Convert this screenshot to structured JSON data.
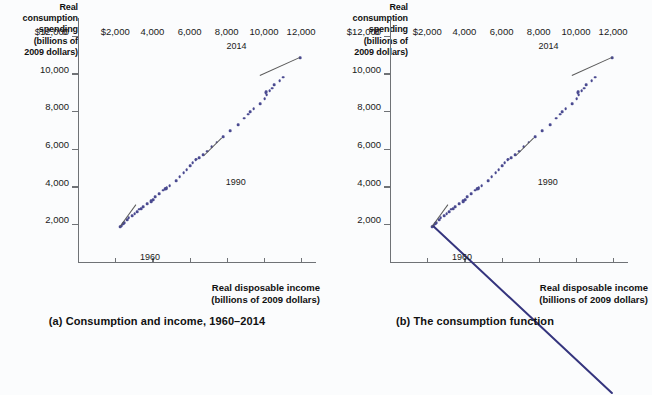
{
  "figure": {
    "background_color": "#fbfcfd",
    "dot_color": "#4a4a90",
    "line_color": "#35357e",
    "axis_color": "#6f7276"
  },
  "panels": [
    {
      "id": "a",
      "caption": "(a) Consumption and income, 1960–2014",
      "y_axis_title": "Real consumption spending (billions of 2009 dollars)",
      "x_axis_title": "Real disposable income (billions of 2009 dollars)",
      "y_axis_title_lines": [
        "Real",
        "consumption",
        "spending",
        "(billions of",
        "2009 dollars)"
      ],
      "x_axis_title_lines": [
        "Real disposable income",
        "(billions of 2009 dollars)"
      ],
      "origin_label": "0",
      "annotations": [
        {
          "label": "1960",
          "x": 2262,
          "y": 1930
        },
        {
          "label": "1990",
          "x": 6766,
          "y": 5672
        },
        {
          "label": "2014",
          "x": 11965,
          "y": 10873
        }
      ]
    },
    {
      "id": "b",
      "caption": "(b) The consumption function",
      "y_axis_title": "Real consumption spending (billions of 2009 dollars)",
      "x_axis_title": "Real disposable income (billions of 2009 dollars)",
      "y_axis_title_lines": [
        "Real",
        "consumption",
        "spending",
        "(billions of",
        "2009 dollars)"
      ],
      "x_axis_title_lines": [
        "Real disposable income",
        "(billions of 2009 dollars)"
      ],
      "origin_label": "0",
      "annotations": [
        {
          "label": "1960",
          "x": 2262,
          "y": 1930
        },
        {
          "label": "1990",
          "x": 6766,
          "y": 5672
        },
        {
          "label": "2014",
          "x": 11965,
          "y": 10873
        }
      ]
    }
  ],
  "chart_data": [
    {
      "type": "scatter",
      "panel": "a",
      "title": "(a) Consumption and income, 1960–2014",
      "xlabel": "Real disposable income (billions of 2009 dollars)",
      "ylabel": "Real consumption spending (billions of 2009 dollars)",
      "xlim": [
        0,
        12800
      ],
      "ylim": [
        0,
        13000
      ],
      "xticks": [
        0,
        2000,
        4000,
        6000,
        8000,
        10000,
        12000
      ],
      "xticklabels": [
        "0",
        "$2,000",
        "4,000",
        "6,000",
        "8,000",
        "10,000",
        "12,000"
      ],
      "yticks": [
        2000,
        4000,
        6000,
        8000,
        10000,
        12000
      ],
      "yticklabels": [
        "2,000",
        "4,000",
        "6,000",
        "8,000",
        "10,000",
        "$12,000"
      ],
      "grid": false,
      "legend": false,
      "series": [
        {
          "name": "Consumption vs. disposable income, 1960–2014",
          "x": [
            2262,
            2347,
            2433,
            2483,
            2651,
            2731,
            2902,
            3052,
            3166,
            3297,
            3391,
            3510,
            3702,
            3939,
            3937,
            4040,
            4163,
            4358,
            4578,
            4692,
            4715,
            4767,
            4746,
            4928,
            5274,
            5471,
            5680,
            5842,
            6029,
            6168,
            6320,
            6366,
            6525,
            6739,
            6939,
            7196,
            7462,
            7792,
            8174,
            8607,
            8928,
            9134,
            9257,
            9441,
            9779,
            10045,
            10150,
            10096,
            10115,
            10305,
            10426,
            10553,
            10850,
            11036,
            11965
          ],
          "y": [
            1930,
            1960,
            2063,
            2144,
            2290,
            2395,
            2511,
            2623,
            2726,
            2844,
            2890,
            2990,
            3149,
            3299,
            3263,
            3336,
            3496,
            3665,
            3849,
            3943,
            3930,
            3984,
            3953,
            4112,
            4344,
            4578,
            4792,
            4943,
            5153,
            5316,
            5458,
            5493,
            5588,
            5745,
            5927,
            6158,
            6400,
            6680,
            7000,
            7333,
            7669,
            7889,
            8029,
            8169,
            8445,
            8713,
            8920,
            9033,
            9083,
            9137,
            9265,
            9445,
            9679,
            9851,
            10873
          ],
          "color": "#4a4a90",
          "marker": "circle"
        }
      ],
      "annotations": [
        {
          "text": "1960",
          "point_x": 2262,
          "point_y": 1930
        },
        {
          "text": "1990",
          "point_x": 6766,
          "point_y": 5672
        },
        {
          "text": "2014",
          "point_x": 11965,
          "point_y": 10873
        }
      ]
    },
    {
      "type": "scatter",
      "panel": "b",
      "title": "(b) The consumption function",
      "xlabel": "Real disposable income (billions of 2009 dollars)",
      "ylabel": "Real consumption spending (billions of 2009 dollars)",
      "xlim": [
        0,
        12800
      ],
      "ylim": [
        0,
        13000
      ],
      "xticks": [
        0,
        2000,
        4000,
        6000,
        8000,
        10000,
        12000
      ],
      "xticklabels": [
        "0",
        "$2,000",
        "4,000",
        "6,000",
        "8,000",
        "10,000",
        "12,000"
      ],
      "yticks": [
        2000,
        4000,
        6000,
        8000,
        10000,
        12000
      ],
      "yticklabels": [
        "2,000",
        "4,000",
        "6,000",
        "8,000",
        "10,000",
        "$12,000"
      ],
      "grid": false,
      "legend": false,
      "series": [
        {
          "name": "Consumption vs. disposable income, 1960–2014",
          "x": [
            2262,
            2347,
            2433,
            2483,
            2651,
            2731,
            2902,
            3052,
            3166,
            3297,
            3391,
            3510,
            3702,
            3939,
            3937,
            4040,
            4163,
            4358,
            4578,
            4692,
            4715,
            4767,
            4746,
            4928,
            5274,
            5471,
            5680,
            5842,
            6029,
            6168,
            6320,
            6366,
            6525,
            6739,
            6939,
            7196,
            7462,
            7792,
            8174,
            8607,
            8928,
            9134,
            9257,
            9441,
            9779,
            10045,
            10150,
            10096,
            10115,
            10305,
            10426,
            10553,
            10850,
            11036,
            11965
          ],
          "y": [
            1930,
            1960,
            2063,
            2144,
            2290,
            2395,
            2511,
            2623,
            2726,
            2844,
            2890,
            2990,
            3149,
            3299,
            3263,
            3336,
            3496,
            3665,
            3849,
            3943,
            3930,
            3984,
            3953,
            4112,
            4344,
            4578,
            4792,
            4943,
            5153,
            5316,
            5458,
            5493,
            5588,
            5745,
            5927,
            6158,
            6400,
            6680,
            7000,
            7333,
            7669,
            7889,
            8029,
            8169,
            8445,
            8713,
            8920,
            9033,
            9083,
            9137,
            9265,
            9445,
            9679,
            9851,
            10873
          ],
          "color": "#4a4a90",
          "marker": "circle"
        },
        {
          "name": "Consumption function (fitted line)",
          "type": "line",
          "x": [
            2262,
            11965
          ],
          "y": [
            1930,
            10873
          ],
          "color": "#35357e"
        }
      ],
      "annotations": [
        {
          "text": "1960",
          "point_x": 2262,
          "point_y": 1930
        },
        {
          "text": "1990",
          "point_x": 6766,
          "point_y": 5672
        },
        {
          "text": "2014",
          "point_x": 11965,
          "point_y": 10873
        }
      ]
    }
  ]
}
